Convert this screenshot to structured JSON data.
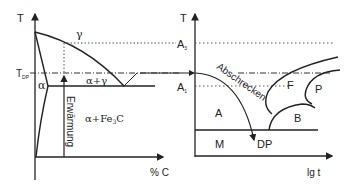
{
  "left_diagram": {
    "title": "Phase diagram (Fe-C, section)",
    "y_axis_label": "T",
    "x_axis_label": "% C",
    "t_dp_label_main": "T",
    "t_dp_label_sub": "DP",
    "regions": {
      "gamma": "γ",
      "alpha": "α",
      "alpha_gamma": "α+γ",
      "alpha_fe3c_prefix": "α+Fe",
      "alpha_fe3c_sub": "3",
      "alpha_fe3c_suffix": "C"
    },
    "heating_label": "Erwärmung"
  },
  "right_diagram": {
    "title": "Time-temperature transformation diagram",
    "y_axis_label": "T",
    "x_axis_label": "lg t",
    "a3_main": "A",
    "a3_sub": "3",
    "a1_main": "A",
    "a1_sub": "1",
    "quench_label": "Abschrecken",
    "regions": {
      "austenite": "A",
      "ferrite": "F",
      "pearlite": "P",
      "bainite": "B",
      "martensite": "M"
    },
    "dp_label": "DP"
  },
  "colors": {
    "line": "#222222",
    "dotted": "#555555",
    "background": "#ffffff"
  }
}
